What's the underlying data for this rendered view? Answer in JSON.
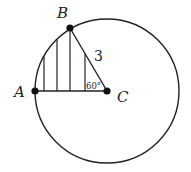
{
  "diagram": {
    "type": "geometry",
    "circle": {
      "center": "C",
      "cx": 107,
      "cy": 91,
      "r": 72
    },
    "points": [
      {
        "name": "A",
        "label": "A",
        "x": 35,
        "y": 91,
        "label_x": 14,
        "label_y": 97
      },
      {
        "name": "B",
        "label": "B",
        "x": 70,
        "y": 28,
        "label_x": 57,
        "label_y": 18
      },
      {
        "name": "C",
        "label": "C",
        "x": 107,
        "y": 91,
        "label_x": 117,
        "label_y": 102
      }
    ],
    "radius_label": {
      "text": "3",
      "x": 94,
      "y": 61
    },
    "angle_label": {
      "text": "60°",
      "x": 86,
      "y": 89
    },
    "hatch_x": [
      44,
      57,
      70,
      85
    ],
    "stroke_color": "#222222"
  }
}
